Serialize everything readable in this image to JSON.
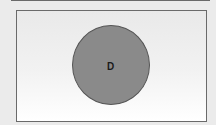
{
  "diagram": {
    "type": "venn",
    "sets": [
      {
        "label": "D",
        "fill_color": "#8a8a8a",
        "border_color": "#555555"
      }
    ]
  },
  "colors": {
    "background": "#ebebeb",
    "panel_border": "#6a6a6a"
  }
}
